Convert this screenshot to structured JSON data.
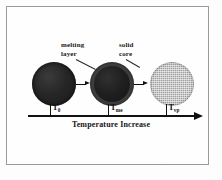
{
  "diagram": {
    "background_color": "#fdfdfd",
    "frame_color": "#9a9a9a",
    "ink_color": "#111111"
  },
  "callouts": [
    {
      "id": "melting-layer",
      "line1": "melting",
      "line2": "layer",
      "points_to": "partially-molten-particle"
    },
    {
      "id": "solid-core",
      "line1": "solid",
      "line2": "core",
      "points_to": "partially-molten-particle"
    }
  ],
  "particles": [
    {
      "id": "solid",
      "state": "fully solid",
      "fill_color": "#262626",
      "shell_color": "#262626"
    },
    {
      "id": "partially-molten",
      "state": "solid core with melting layer",
      "fill_color": "#1f1f1f",
      "shell_color": "#3e3e3e"
    },
    {
      "id": "molten",
      "state": "fully molten",
      "fill_color": "#9e9e9e",
      "shell_color": "#9e9e9e"
    }
  ],
  "axis": {
    "caption": "Temperature Increase",
    "direction": "increasing to the right",
    "ticks": [
      {
        "id": "t0",
        "symbol": "T",
        "subscript": "0",
        "meaning": "initial temperature"
      },
      {
        "id": "tme",
        "symbol": "T",
        "subscript": "me",
        "meaning": "melting temperature"
      },
      {
        "id": "tvp",
        "symbol": "T",
        "subscript": "vp",
        "meaning": "vaporization temperature"
      }
    ]
  },
  "step_arrows": [
    {
      "id": "step-1",
      "from": "solid",
      "to": "partially-molten"
    },
    {
      "id": "step-2",
      "from": "partially-molten",
      "to": "molten"
    }
  ]
}
